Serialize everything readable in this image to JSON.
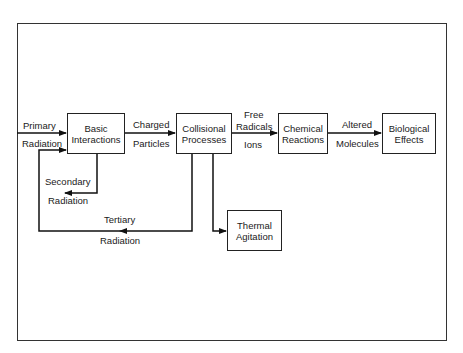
{
  "diagram": {
    "boxes": {
      "basic": {
        "line1": "Basic",
        "line2": "Interactions"
      },
      "collisional": {
        "line1": "Collisional",
        "line2": "Processes"
      },
      "chemical": {
        "line1": "Chemical",
        "line2": "Reactions"
      },
      "biological": {
        "line1": "Biological",
        "line2": "Effects"
      },
      "thermal": {
        "line1": "Thermal",
        "line2": "Agitation"
      }
    },
    "labels": {
      "primary_top": "Primary",
      "primary_bottom": "Radiation",
      "charged_top": "Charged",
      "charged_bottom": "Particles",
      "free_top": "Free",
      "free_mid": "Radicals",
      "free_bottom": "Ions",
      "altered_top": "Altered",
      "altered_bottom": "Molecules",
      "secondary_top": "Secondary",
      "secondary_bottom": "Radiation",
      "tertiary_top": "Tertiary",
      "tertiary_bottom": "Radiation"
    }
  }
}
